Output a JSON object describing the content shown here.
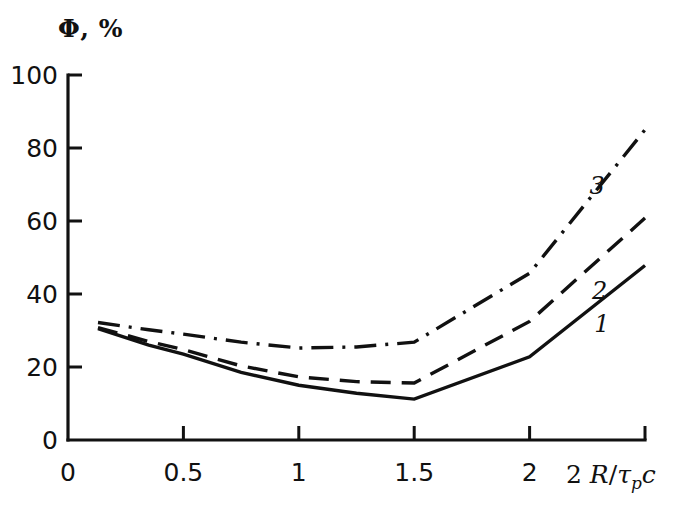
{
  "chart_data": {
    "type": "line",
    "title": "",
    "ylabel": "Φ, %",
    "xlabel": "2 R/τₚc",
    "xlabel_parts": {
      "lead": "2",
      "numerator": "R",
      "slash": "/",
      "tau": "τ",
      "subscript": "p",
      "trailing": "c"
    },
    "xlim": [
      0,
      2.5
    ],
    "ylim": [
      0,
      100
    ],
    "xticks": [
      0,
      0.5,
      1,
      1.5,
      2,
      2.5
    ],
    "xtick_labels": [
      "0",
      "0.5",
      "1",
      "1.5",
      "2",
      ""
    ],
    "yticks": [
      0,
      20,
      40,
      60,
      80,
      100
    ],
    "ytick_labels": [
      "0",
      "20",
      "40",
      "60",
      "80",
      "100"
    ],
    "grid": false,
    "legend": "inline curve numbers 1, 2, 3 placed next to each curve",
    "line_color": "#111111",
    "series": [
      {
        "name": "1",
        "label": "1",
        "style": "solid",
        "label_x": 2.28,
        "label_y": 35,
        "x": [
          0.13,
          0.35,
          0.5,
          0.75,
          1.0,
          1.25,
          1.5,
          2.0,
          2.5
        ],
        "y": [
          30.5,
          26.0,
          23.5,
          18.5,
          15.0,
          12.8,
          11.2,
          22.8,
          47.8
        ]
      },
      {
        "name": "2",
        "label": "2",
        "style": "dashed",
        "label_x": 2.27,
        "label_y": 44,
        "x": [
          0.13,
          0.35,
          0.5,
          0.75,
          1.0,
          1.25,
          1.5,
          2.0,
          2.5
        ],
        "y": [
          30.8,
          27.0,
          24.8,
          20.3,
          17.3,
          16.0,
          15.6,
          32.5,
          60.8
        ]
      },
      {
        "name": "3",
        "label": "3",
        "style": "dash-dot",
        "label_x": 2.26,
        "label_y": 73,
        "x": [
          0.13,
          0.35,
          0.5,
          0.75,
          1.0,
          1.25,
          1.5,
          2.0,
          2.5
        ],
        "y": [
          32.2,
          30.2,
          29.0,
          26.8,
          25.2,
          25.5,
          26.8,
          45.7,
          85.0
        ]
      }
    ]
  }
}
